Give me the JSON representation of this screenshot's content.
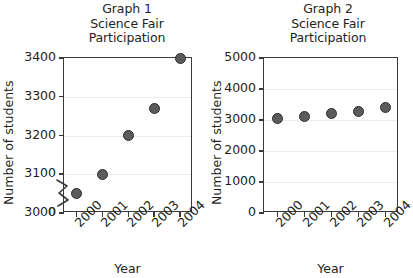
{
  "figure": {
    "background": "#ffffff",
    "text_color": "#231f20",
    "marker_fill": "#5b5b5b",
    "marker_stroke": "#2e2e2e",
    "axis_color": "#3a3a3a",
    "grid_color": "#eceaea"
  },
  "chart_data": [
    {
      "type": "scatter",
      "title": "Graph 1\nScience Fair\nParticipation",
      "title_lines": [
        "Graph 1",
        "Science Fair",
        "Participation"
      ],
      "xlabel": "Year",
      "ylabel": "Number of students",
      "categories": [
        "2000",
        "2001",
        "2002",
        "2003",
        "2004"
      ],
      "values": [
        3050,
        3100,
        3200,
        3270,
        3400
      ],
      "yticks": [
        0,
        3000,
        3100,
        3200,
        3300,
        3400
      ],
      "ytick_labels": [
        "0",
        "3000",
        "3100",
        "3200",
        "3300",
        "3400"
      ],
      "ylim": [
        3000,
        3400
      ],
      "axis_break": true,
      "axis_break_note": "zigzag break between 0 and 3000",
      "grid": true,
      "legend": "none"
    },
    {
      "type": "scatter",
      "title": "Graph 2\nScience Fair\nParticipation",
      "title_lines": [
        "Graph 2",
        "Science Fair",
        "Participation"
      ],
      "xlabel": "Year",
      "ylabel": "Number of students",
      "categories": [
        "2000",
        "2001",
        "2002",
        "2003",
        "2004"
      ],
      "values": [
        3050,
        3100,
        3200,
        3270,
        3400
      ],
      "yticks": [
        0,
        1000,
        2000,
        3000,
        4000,
        5000
      ],
      "ytick_labels": [
        "0",
        "1000",
        "2000",
        "3000",
        "4000",
        "5000"
      ],
      "ylim": [
        0,
        5000
      ],
      "axis_break": false,
      "grid": true,
      "legend": "none"
    }
  ]
}
